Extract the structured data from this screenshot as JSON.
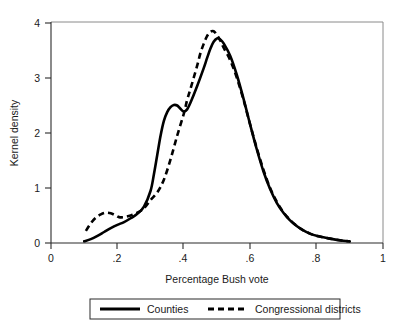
{
  "chart_data": {
    "type": "line",
    "title": "",
    "xlabel": "Percentage Bush vote",
    "ylabel": "Kernel density",
    "xlim": [
      0,
      1
    ],
    "ylim": [
      0,
      4.2
    ],
    "xticks": [
      0,
      0.2,
      0.4,
      0.6,
      0.8,
      1
    ],
    "xticklabels": [
      "0",
      ".2",
      ".4",
      ".6",
      ".8",
      "1"
    ],
    "yticks": [
      0,
      1,
      2,
      3,
      4
    ],
    "yticklabels": [
      "0",
      "1",
      "2",
      "3",
      "4"
    ],
    "grid": false,
    "legend_position": "below",
    "series": [
      {
        "name": "Counties",
        "style": "solid",
        "color": "#000000",
        "x": [
          0.1,
          0.12,
          0.14,
          0.16,
          0.18,
          0.2,
          0.22,
          0.24,
          0.26,
          0.28,
          0.3,
          0.31,
          0.32,
          0.33,
          0.34,
          0.35,
          0.36,
          0.37,
          0.38,
          0.39,
          0.4,
          0.41,
          0.42,
          0.44,
          0.46,
          0.47,
          0.48,
          0.49,
          0.5,
          0.51,
          0.52,
          0.54,
          0.56,
          0.58,
          0.6,
          0.62,
          0.64,
          0.66,
          0.68,
          0.7,
          0.72,
          0.74,
          0.76,
          0.78,
          0.8,
          0.84,
          0.88,
          0.9
        ],
        "y": [
          0.03,
          0.07,
          0.13,
          0.2,
          0.27,
          0.33,
          0.38,
          0.45,
          0.53,
          0.66,
          0.95,
          1.25,
          1.6,
          1.95,
          2.22,
          2.38,
          2.47,
          2.51,
          2.5,
          2.44,
          2.39,
          2.43,
          2.55,
          2.85,
          3.18,
          3.36,
          3.53,
          3.66,
          3.72,
          3.7,
          3.63,
          3.4,
          3.05,
          2.62,
          2.15,
          1.7,
          1.3,
          0.98,
          0.73,
          0.55,
          0.41,
          0.31,
          0.23,
          0.17,
          0.13,
          0.08,
          0.04,
          0.03
        ]
      },
      {
        "name": "Congressional districts",
        "style": "dashed",
        "color": "#000000",
        "x": [
          0.105,
          0.12,
          0.135,
          0.15,
          0.165,
          0.18,
          0.195,
          0.205,
          0.22,
          0.24,
          0.26,
          0.28,
          0.3,
          0.32,
          0.34,
          0.36,
          0.38,
          0.4,
          0.41,
          0.42,
          0.44,
          0.45,
          0.46,
          0.47,
          0.48,
          0.49,
          0.5,
          0.51,
          0.52,
          0.54,
          0.56,
          0.58,
          0.6,
          0.62,
          0.64,
          0.66,
          0.68,
          0.7,
          0.72,
          0.74,
          0.76,
          0.78,
          0.8,
          0.84,
          0.88,
          0.9
        ],
        "y": [
          0.22,
          0.36,
          0.46,
          0.52,
          0.55,
          0.54,
          0.5,
          0.47,
          0.47,
          0.5,
          0.55,
          0.63,
          0.78,
          0.92,
          1.15,
          1.52,
          1.95,
          2.35,
          2.6,
          2.8,
          3.22,
          3.45,
          3.62,
          3.76,
          3.84,
          3.85,
          3.78,
          3.68,
          3.55,
          3.32,
          3.0,
          2.6,
          2.15,
          1.72,
          1.33,
          1.0,
          0.75,
          0.56,
          0.42,
          0.31,
          0.23,
          0.17,
          0.13,
          0.08,
          0.04,
          0.03
        ]
      }
    ]
  },
  "legend": {
    "entries": [
      {
        "label": "Counties",
        "style": "solid"
      },
      {
        "label": "Congressional districts",
        "style": "dashed"
      }
    ]
  }
}
